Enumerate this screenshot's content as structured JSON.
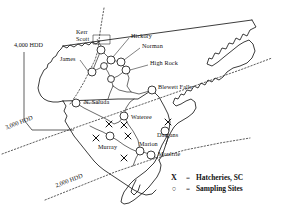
{
  "figure": {
    "type": "thematic-map",
    "region": "North Carolina and South Carolina",
    "background_color": "#ffffff",
    "line_color": "#1a1a1a"
  },
  "isolines": [
    {
      "id": "hdd-4000",
      "label": "4,000 HDD",
      "rotation_deg": 0,
      "x": 14,
      "y": 44
    },
    {
      "id": "hdd-3000",
      "label": "3,000 HDD",
      "rotation_deg": 21,
      "x": 6,
      "y": 124
    },
    {
      "id": "hdd-2000",
      "label": "2,000 HDD",
      "rotation_deg": 21,
      "x": 55,
      "y": 178
    }
  ],
  "sampling_sites": [
    {
      "name": "Kerr Scott",
      "label_lines": [
        "Kerr",
        "Scott"
      ],
      "label_x": 76,
      "label_y": 32,
      "cx": 101,
      "cy": 50,
      "boxed": true
    },
    {
      "name": "Hickory",
      "label_lines": [
        "Hickory"
      ],
      "label_x": 131,
      "label_y": 35,
      "cx": 111,
      "cy": 60
    },
    {
      "name": "Norman",
      "label_lines": [
        "Norman"
      ],
      "label_x": 142,
      "label_y": 45,
      "cx": 121,
      "cy": 62
    },
    {
      "name": "High Rock",
      "label_lines": [
        "High Rock"
      ],
      "label_x": 150,
      "label_y": 62,
      "cx": 126,
      "cy": 70
    },
    {
      "name": "James",
      "label_lines": [
        "James"
      ],
      "label_x": 62,
      "label_y": 58,
      "cx": 92,
      "cy": 72
    },
    {
      "name": "Blewett Falls",
      "label_lines": [
        "Blewett Falls"
      ],
      "label_x": 157,
      "label_y": 86,
      "cx": 152,
      "cy": 90
    },
    {
      "name": "N. Saluda",
      "label_lines": [
        "N. Saluda"
      ],
      "label_x": 85,
      "label_y": 101,
      "cx": 76,
      "cy": 103
    },
    {
      "name": "Wateree",
      "label_lines": [
        "Wateree"
      ],
      "label_x": 133,
      "label_y": 117,
      "cx": 124,
      "cy": 116
    },
    {
      "name": "Dargans",
      "label_lines": [
        "Dargans"
      ],
      "label_x": 158,
      "label_y": 135,
      "cx": 165,
      "cy": 131
    },
    {
      "name": "Marion",
      "label_lines": [
        "Marion"
      ],
      "label_x": 141,
      "label_y": 142,
      "cx": 140,
      "cy": 151
    },
    {
      "name": "Moultrie",
      "label_lines": [
        "Moultrie"
      ],
      "label_x": 160,
      "label_y": 150,
      "cx": 151,
      "cy": 155
    },
    {
      "name": "Murray",
      "label_lines": [
        "Murray"
      ],
      "label_x": 100,
      "label_y": 144,
      "cx": 110,
      "cy": 136
    }
  ],
  "hatcheries": [
    {
      "id": "hatchery-1",
      "x": 109,
      "y": 124
    },
    {
      "id": "hatchery-2",
      "x": 124,
      "y": 125
    },
    {
      "id": "hatchery-3",
      "x": 128,
      "y": 136
    },
    {
      "id": "hatchery-4",
      "x": 124,
      "y": 158
    },
    {
      "id": "hatchery-5",
      "x": 168,
      "y": 122
    },
    {
      "id": "hatchery-6",
      "x": 96,
      "y": 138
    }
  ],
  "legend": {
    "rows": [
      {
        "symbol": "X",
        "equals": "=",
        "text": "Hatcheries, SC"
      },
      {
        "symbol": "○",
        "equals": "=",
        "text": "Sampling Sites"
      }
    ]
  }
}
